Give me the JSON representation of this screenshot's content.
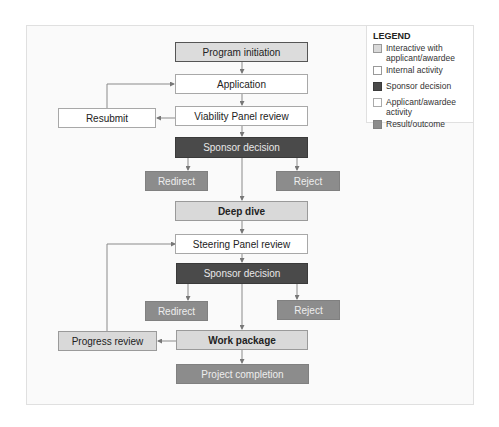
{
  "diagram": {
    "nodes": {
      "program_initiation": "Program initiation",
      "application": "Application",
      "viability_panel_review": "Viability Panel review",
      "resubmit": "Resubmit",
      "sponsor_decision_1": "Sponsor decision",
      "redirect_1": "Redirect",
      "reject_1": "Reject",
      "deep_dive": "Deep dive",
      "steering_panel_review": "Steering Panel review",
      "sponsor_decision_2": "Sponsor decision",
      "redirect_2": "Redirect",
      "reject_2": "Reject",
      "work_package": "Work package",
      "progress_review": "Progress review",
      "project_completion": "Project completion"
    },
    "edges": [
      {
        "from": "Program initiation",
        "to": "Application"
      },
      {
        "from": "Application",
        "to": "Viability Panel review"
      },
      {
        "from": "Viability Panel review",
        "to": "Resubmit"
      },
      {
        "from": "Resubmit",
        "to": "Application"
      },
      {
        "from": "Viability Panel review",
        "to": "Sponsor decision"
      },
      {
        "from": "Sponsor decision",
        "to": "Redirect"
      },
      {
        "from": "Sponsor decision",
        "to": "Reject"
      },
      {
        "from": "Sponsor decision",
        "to": "Deep dive"
      },
      {
        "from": "Deep dive",
        "to": "Steering Panel review"
      },
      {
        "from": "Steering Panel review",
        "to": "Sponsor decision (2)"
      },
      {
        "from": "Sponsor decision (2)",
        "to": "Redirect (2)"
      },
      {
        "from": "Sponsor decision (2)",
        "to": "Reject (2)"
      },
      {
        "from": "Sponsor decision (2)",
        "to": "Work package"
      },
      {
        "from": "Work package",
        "to": "Progress review"
      },
      {
        "from": "Progress review",
        "to": "Steering Panel review"
      },
      {
        "from": "Work package",
        "to": "Project completion"
      }
    ],
    "colors": {
      "interactive": "#d9d9d9",
      "internal": "#ffffff",
      "sponsor": "#4a4a4a",
      "result": "#8c8c8c",
      "connector": "#8a8a8a"
    }
  },
  "legend": {
    "title": "LEGEND",
    "items": [
      {
        "label": "Interactive with applicant/awardee",
        "swatch": "#d9d9d9"
      },
      {
        "label": "Internal activity",
        "swatch": "#ffffff"
      },
      {
        "label": "Sponsor decision",
        "swatch": "#4a4a4a"
      },
      {
        "label": "Applicant/awardee activity",
        "swatch": "#ffffff"
      },
      {
        "label": "Result/outcome",
        "swatch": "#8c8c8c"
      }
    ]
  }
}
